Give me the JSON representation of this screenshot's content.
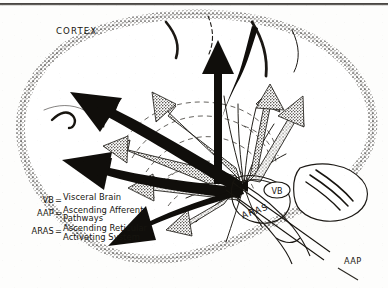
{
  "figure": {
    "kind": "brain-sagittal-diagram",
    "title_label": "CORTEX",
    "background_color": "#fdfdfc",
    "ink_color": "#17150f",
    "stipple_color": "#6f6a62"
  },
  "labels": {
    "cortex": "CORTEX",
    "vb_callout": "VB",
    "aras_callout": "ARAS",
    "aap_callout": "AAP"
  },
  "legend": {
    "rows": [
      {
        "abbr": "VB",
        "eq": "=",
        "line1": "Visceral Brain",
        "line2": ""
      },
      {
        "abbr": "AAP",
        "eq": "=",
        "line1": "Ascending Afferent",
        "line2": "Pathways"
      },
      {
        "abbr": "ARAS",
        "eq": "=",
        "line1": "Ascending Reticular",
        "line2": "Activating System"
      }
    ]
  },
  "marks": {
    "rule_top": "page-rule",
    "solid_arrow_count": 4,
    "stippled_arrow_count": 5,
    "radiating_line_count": 9
  }
}
